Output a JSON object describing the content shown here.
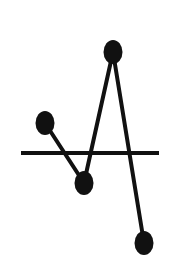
{
  "chart_data": {
    "type": "line",
    "title": "",
    "xlabel": "",
    "ylabel": "",
    "grid": false,
    "legend": null,
    "x": [
      1,
      2,
      3,
      4
    ],
    "series": [
      {
        "name": "series-1",
        "values": [
          1.0,
          -1.0,
          3.4,
          -3.0
        ],
        "color": "#000000",
        "marker": "filled-ellipse"
      }
    ],
    "baseline": {
      "y": 0,
      "color": "#000000"
    },
    "ylim": [
      -3.6,
      4.2
    ],
    "xlim": [
      0.3,
      4.7
    ]
  },
  "render": {
    "width": 182,
    "height": 273,
    "baseline_px": {
      "x1": 21,
      "x2": 159,
      "y": 153
    },
    "points_px": [
      {
        "x": 45,
        "y": 123
      },
      {
        "x": 84,
        "y": 183
      },
      {
        "x": 113,
        "y": 52
      },
      {
        "x": 144,
        "y": 243
      }
    ],
    "marker_rx": 9.5,
    "marker_ry": 12,
    "line_width": 4,
    "baseline_width": 4,
    "stroke_color": "#111111",
    "background": "#ffffff"
  }
}
